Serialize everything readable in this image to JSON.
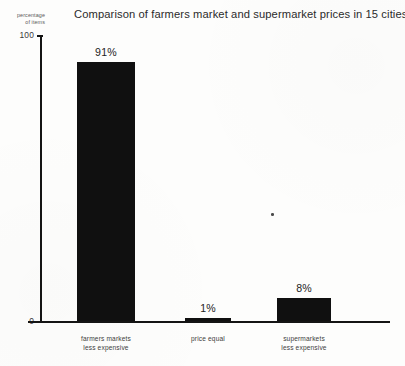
{
  "chart_data": {
    "type": "bar",
    "title": "Comparison of farmers market and supermarket prices in 15 cities.",
    "xlabel": "",
    "ylabel": "percentage of items",
    "ylim": [
      0,
      100
    ],
    "ytick_labels": [
      "0",
      "100"
    ],
    "grid": false,
    "legend": "none",
    "categories": [
      "farmers markets less expensive",
      "price equal",
      "supermarkets less expensive"
    ],
    "category_lines": [
      [
        "farmers  markets",
        "less  expensive"
      ],
      [
        "price equal",
        ""
      ],
      [
        "supermarkets",
        "less  expensive"
      ]
    ],
    "values": [
      91,
      1,
      8
    ],
    "value_labels": [
      "91%",
      "1%",
      "8%"
    ],
    "bar_color": "#101010",
    "axis_color": "#141414",
    "background_color": "#fdfdfc"
  },
  "axis": {
    "y_label_line1": "percentage",
    "y_label_line2": "of items",
    "y_top_tick": "100",
    "y_bottom_tick": "0"
  },
  "artifacts": {
    "speck_label": "scan-speck"
  }
}
